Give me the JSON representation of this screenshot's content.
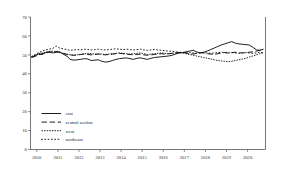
{
  "chart_data": {
    "type": "line",
    "title": "",
    "subtitle": "",
    "xlabel": "",
    "ylabel": "",
    "xlim": [
      2009.7,
      2020.85
    ],
    "ylim": [
      0,
      70
    ],
    "grid": false,
    "legend_position": "lower-left",
    "x_tick_labels": [
      "2010",
      "2011",
      "2012",
      "2013",
      "2014",
      "2015",
      "2016",
      "2017",
      "2018",
      "2019",
      "2020"
    ],
    "x_ticks": [
      2010,
      2011,
      2012,
      2013,
      2014,
      2015,
      2016,
      2017,
      2018,
      2019,
      2020
    ],
    "y_tick_labels": [
      "0",
      "10",
      "20",
      "30",
      "40",
      "50",
      "60",
      "70"
    ],
    "y_ticks": [
      0,
      10,
      20,
      30,
      40,
      50,
      60,
      70
    ],
    "x": [
      2009.75,
      2009.92,
      2010.08,
      2010.25,
      2010.42,
      2010.58,
      2010.75,
      2010.92,
      2011.08,
      2011.25,
      2011.42,
      2011.58,
      2011.75,
      2011.92,
      2012.08,
      2012.25,
      2012.42,
      2012.58,
      2012.75,
      2012.92,
      2013.08,
      2013.25,
      2013.42,
      2013.58,
      2013.75,
      2013.92,
      2014.08,
      2014.25,
      2014.42,
      2014.58,
      2014.75,
      2014.92,
      2015.08,
      2015.25,
      2015.42,
      2015.58,
      2015.75,
      2015.92,
      2016.08,
      2016.25,
      2016.42,
      2016.58,
      2016.75,
      2016.92,
      2017.08,
      2017.25,
      2017.42,
      2017.58,
      2017.75,
      2017.92,
      2018.08,
      2018.25,
      2018.42,
      2018.58,
      2018.75,
      2018.92,
      2019.08,
      2019.25,
      2019.42,
      2019.58,
      2019.75,
      2019.92,
      2020.08,
      2020.25,
      2020.42,
      2020.58,
      2020.75
    ],
    "series": [
      {
        "name": "east",
        "style": "solid",
        "color": "#111111",
        "values": [
          48.8,
          49.6,
          50.4,
          50.2,
          51.2,
          51.6,
          51.0,
          51.4,
          51.6,
          50.4,
          49.4,
          47.6,
          47.2,
          47.4,
          47.6,
          48.0,
          47.8,
          47.0,
          47.2,
          47.4,
          46.6,
          46.2,
          46.4,
          47.0,
          47.6,
          48.0,
          48.2,
          48.4,
          48.0,
          47.6,
          48.2,
          48.4,
          48.0,
          47.6,
          48.2,
          48.6,
          48.8,
          49.0,
          49.2,
          49.4,
          49.8,
          50.4,
          51.0,
          51.2,
          51.6,
          52.0,
          52.4,
          51.6,
          51.0,
          51.4,
          52.0,
          52.8,
          53.6,
          54.4,
          55.2,
          55.8,
          56.4,
          57.0,
          56.2,
          55.8,
          55.6,
          55.4,
          55.2,
          54.0,
          52.6,
          52.4,
          53.0
        ]
      },
      {
        "name": "central section",
        "style": "dashed",
        "color": "#111111",
        "values": [
          48.6,
          49.2,
          50.0,
          50.6,
          51.0,
          51.4,
          51.6,
          51.8,
          51.4,
          50.8,
          50.2,
          50.0,
          49.8,
          50.0,
          50.2,
          50.4,
          50.2,
          50.0,
          50.2,
          50.4,
          50.2,
          50.0,
          50.2,
          50.4,
          50.6,
          50.8,
          50.6,
          50.4,
          50.2,
          50.0,
          50.2,
          50.4,
          50.0,
          49.8,
          50.0,
          50.2,
          50.4,
          50.6,
          50.4,
          50.6,
          50.8,
          51.0,
          51.2,
          51.4,
          51.0,
          50.6,
          50.4,
          50.8,
          51.2,
          51.0,
          50.6,
          50.4,
          50.2,
          50.6,
          51.0,
          51.2,
          51.0,
          51.2,
          51.4,
          51.2,
          51.0,
          51.2,
          51.4,
          51.6,
          52.0,
          52.4,
          53.0
        ]
      },
      {
        "name": "west",
        "style": "dotted-fine",
        "color": "#111111",
        "values": [
          49.0,
          49.8,
          50.6,
          51.0,
          51.4,
          51.8,
          52.0,
          51.6,
          51.2,
          50.8,
          50.4,
          50.0,
          49.8,
          50.0,
          50.2,
          50.6,
          50.8,
          50.6,
          50.4,
          50.6,
          50.4,
          50.2,
          50.4,
          50.6,
          50.8,
          51.0,
          50.8,
          50.6,
          50.4,
          50.6,
          50.8,
          51.0,
          50.6,
          50.2,
          50.4,
          50.6,
          50.8,
          51.0,
          50.8,
          50.6,
          50.8,
          51.0,
          51.2,
          51.0,
          50.6,
          50.2,
          49.8,
          49.4,
          49.0,
          48.6,
          48.2,
          47.8,
          47.4,
          47.0,
          46.8,
          46.6,
          46.4,
          46.6,
          47.0,
          47.4,
          47.8,
          48.2,
          48.8,
          49.4,
          50.0,
          50.6,
          51.2
        ]
      },
      {
        "name": "northeast",
        "style": "dotted-sparse",
        "color": "#111111",
        "values": [
          49.2,
          50.2,
          51.2,
          52.0,
          52.6,
          53.0,
          53.4,
          54.6,
          53.6,
          53.2,
          52.8,
          52.4,
          52.6,
          52.8,
          52.6,
          53.0,
          52.8,
          52.6,
          52.8,
          53.0,
          52.8,
          52.6,
          52.8,
          53.0,
          53.2,
          53.0,
          52.8,
          53.0,
          52.8,
          52.6,
          52.8,
          53.0,
          52.6,
          52.4,
          52.6,
          52.8,
          52.6,
          52.4,
          52.2,
          52.0,
          51.8,
          51.6,
          51.4,
          51.2,
          51.0,
          51.2,
          51.0,
          50.8,
          51.0,
          51.2,
          51.0,
          50.8,
          51.0,
          51.2,
          51.4,
          51.2,
          51.0,
          51.2,
          51.0,
          50.8,
          51.0,
          51.2,
          51.0,
          50.8,
          51.0,
          51.4,
          51.0
        ]
      }
    ],
    "legend": [
      {
        "label": "east",
        "style": "solid"
      },
      {
        "label": "central section",
        "style": "dashed"
      },
      {
        "label": "west",
        "style": "dotted-fine"
      },
      {
        "label": "northeast",
        "style": "dotted-sparse"
      }
    ]
  }
}
